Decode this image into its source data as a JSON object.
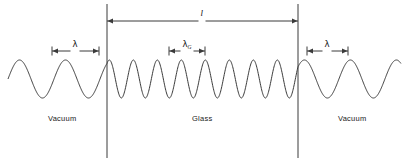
{
  "figure": {
    "type": "physics-diagram",
    "background_color": "#ffffff",
    "stroke_color": "#3a3a3a",
    "text_color": "#1a1a1a",
    "width": 409,
    "height": 162
  },
  "regions": [
    {
      "id": "vacuum-left",
      "label": "Vacuum",
      "label_x": 62,
      "label_y": 118
    },
    {
      "id": "glass",
      "label": "Glass",
      "label_x": 202,
      "label_y": 118
    },
    {
      "id": "vacuum-right",
      "label": "Vacuum",
      "label_x": 352,
      "label_y": 118
    }
  ],
  "boundaries": [
    {
      "id": "left-interface",
      "x": 107,
      "y_top": 4,
      "y_bottom": 158
    },
    {
      "id": "right-interface",
      "x": 298,
      "y_top": 4,
      "y_bottom": 158
    }
  ],
  "dimensions": [
    {
      "id": "slab-thickness",
      "symbol": "l",
      "symbol_style": "italic",
      "x_start": 107,
      "x_end": 298,
      "y": 21,
      "label_x": 202,
      "label_y": 13
    },
    {
      "id": "wavelength-vacuum-left",
      "symbol": "λ",
      "subscript": "",
      "x_start": 52,
      "x_end": 99,
      "y": 51,
      "label_x": 75,
      "label_y": 44
    },
    {
      "id": "wavelength-glass",
      "symbol": "λ",
      "subscript": "G",
      "x_start": 169,
      "x_end": 205,
      "y": 51,
      "label_x": 187,
      "label_y": 44
    },
    {
      "id": "wavelength-vacuum-right",
      "symbol": "λ",
      "subscript": "",
      "x_start": 307,
      "x_end": 348,
      "y": 51,
      "label_x": 327,
      "label_y": 44
    }
  ],
  "chart_data": {
    "type": "line",
    "title": "",
    "xlabel": "",
    "ylabel": "",
    "grid": false,
    "legend": "none",
    "baseline_y": 79,
    "amplitude": 19,
    "segments": [
      {
        "name": "vacuum-left",
        "x_start": 8,
        "x_end": 107,
        "wavelength": 46,
        "cycles": 2.15
      },
      {
        "name": "glass",
        "x_start": 107,
        "x_end": 298,
        "wavelength": 24,
        "cycles": 8.0
      },
      {
        "name": "vacuum-right",
        "x_start": 298,
        "x_end": 401,
        "wavelength": 46,
        "cycles": 2.24
      }
    ]
  }
}
